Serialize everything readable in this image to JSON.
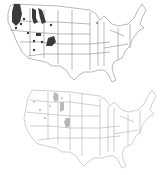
{
  "figure": {
    "maps": [
      {
        "id": "top",
        "description": "United States map with dark-shaded distribution areas in the western states",
        "fill_color": "#3a3a3a",
        "outline_color": "#8a8a8a"
      },
      {
        "id": "bottom",
        "description": "United States map with light-gray shaded distribution areas in the western states",
        "fill_color": "#b8b8b8",
        "outline_color": "#b0b0b0"
      }
    ]
  }
}
